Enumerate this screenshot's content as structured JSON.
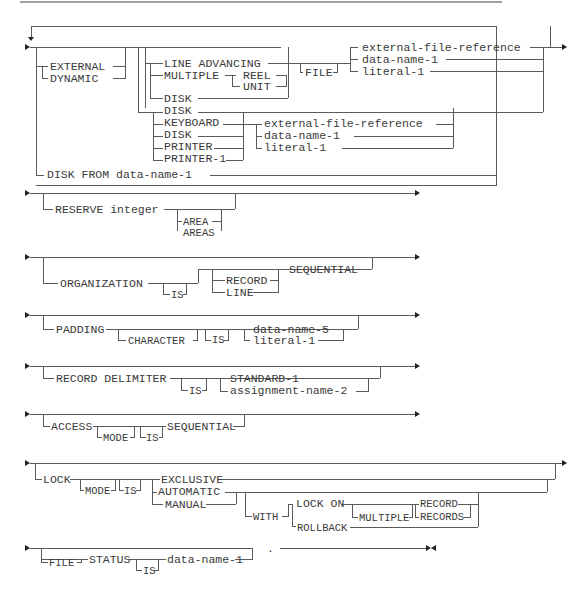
{
  "assign": {
    "external": "EXTERNAL",
    "dynamic": "DYNAMIC",
    "line_advancing": "LINE ADVANCING",
    "multiple": "MULTIPLE",
    "reel": "REEL",
    "unit": "UNIT",
    "file": "FILE",
    "disk_a": "DISK",
    "disk_b": "DISK",
    "keyboard": "KEYBOARD",
    "disk_c": "DISK",
    "printer": "PRINTER",
    "printer_1": "PRINTER-1",
    "ext_file_ref_1": "external-file-reference",
    "data_name_1a": "data-name-1",
    "literal_1a": "literal-1",
    "ext_file_ref_2": "external-file-reference",
    "data_name_1b": "data-name-1",
    "literal_1b": "literal-1",
    "disk_from": "DISK FROM data-name-1"
  },
  "reserve": {
    "reserve_integer": "RESERVE integer",
    "area": "AREA",
    "areas": "AREAS"
  },
  "organization": {
    "organization": "ORGANIZATION",
    "is": "IS",
    "record": "RECORD",
    "line": "LINE",
    "sequential": "SEQUENTIAL"
  },
  "padding": {
    "padding": "PADDING",
    "character": "CHARACTER",
    "is": "IS",
    "data_name_5": "data-name-5",
    "literal_1": "literal-1"
  },
  "record_delimiter": {
    "label": "RECORD DELIMITER",
    "is": "IS",
    "standard_1": "STANDARD-1",
    "assignment_name_2": "assignment-name-2"
  },
  "access": {
    "access": "ACCESS",
    "mode": "MODE",
    "is": "IS",
    "sequential": "SEQUENTIAL"
  },
  "lock": {
    "lock": "LOCK",
    "mode": "MODE",
    "is": "IS",
    "exclusive": "EXCLUSIVE",
    "automatic": "AUTOMATIC",
    "manual": "MANUAL",
    "with": "WITH",
    "lock_on": "LOCK ON",
    "multiple": "MULTIPLE",
    "record": "RECORD",
    "records": "RECORDS",
    "rollback": "ROLLBACK"
  },
  "file_status": {
    "file": "FILE",
    "status": "STATUS",
    "is": "IS",
    "data_name_1": "data-name-1",
    "period": "."
  }
}
